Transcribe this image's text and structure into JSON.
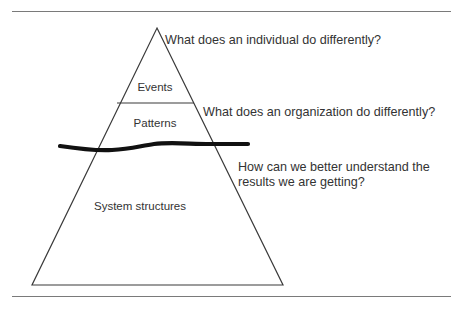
{
  "figure": {
    "colors": {
      "text": "#333333",
      "outline": "#3a3a3a",
      "waterline": "#111111",
      "rule": "#7a7a7a",
      "background": "#ffffff"
    },
    "rules": {
      "top_label": "top-horizontal-rule",
      "bottom_label": "bottom-horizontal-rule"
    },
    "pyramid": {
      "tiers": [
        {
          "id": "events",
          "label": "Events"
        },
        {
          "id": "patterns",
          "label": "Patterns"
        },
        {
          "id": "system-structures",
          "label": "System structures"
        }
      ],
      "waterline_label": "waterline"
    },
    "annotations": [
      {
        "id": "individual",
        "text": "What does an individual do differently?"
      },
      {
        "id": "organization",
        "text": "What does an organization do differently?"
      },
      {
        "id": "results",
        "text": "How can we better understand the\nresults we are getting?"
      }
    ]
  }
}
